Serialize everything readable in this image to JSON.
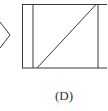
{
  "figure": {
    "label": "(D)",
    "stroke_color": "#3a3a3a",
    "background": "#ffffff",
    "shapes": {
      "left_chevron": {
        "points": "0,22 10,35 0,48"
      },
      "rectangle": {
        "x": 22.5,
        "y": 4.5,
        "width": 90,
        "height": 63.5
      },
      "inner_left_line": {
        "x1": 33,
        "y1": 4.5,
        "x2": 33,
        "y2": 68
      },
      "inner_right_line": {
        "x1": 98,
        "y1": 4.5,
        "x2": 98,
        "y2": 68
      },
      "diagonal": {
        "x1": 37,
        "y1": 68,
        "x2": 96,
        "y2": 4.5
      }
    }
  }
}
